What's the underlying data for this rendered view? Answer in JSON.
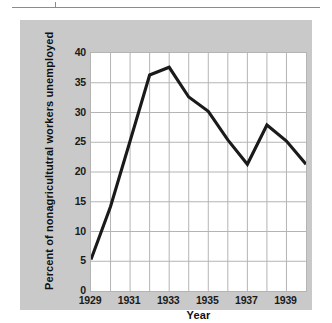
{
  "figure": {
    "background_color": "#ffffff",
    "plate_color": "#c9c9c9",
    "plot_background": "#ffffff",
    "line_color": "#1a1a1a",
    "grid_color": "#b4b4b4"
  },
  "chart_data": {
    "type": "line",
    "title": "",
    "xlabel": "Year",
    "ylabel": "Percent of nonagricultutral workers unemployed",
    "xlim": [
      1929,
      1940
    ],
    "ylim": [
      0,
      40
    ],
    "grid": true,
    "legend": "none",
    "x_tick_labels": [
      "1929",
      "1931",
      "1933",
      "1935",
      "1937",
      "1939"
    ],
    "x_tick_values": [
      1929,
      1931,
      1933,
      1935,
      1937,
      1939
    ],
    "x_minor_gridlines": [
      1930,
      1932,
      1934,
      1936,
      1938,
      1940
    ],
    "y_tick_labels": [
      "0",
      "5",
      "10",
      "15",
      "20",
      "25",
      "30",
      "35",
      "40"
    ],
    "y_tick_values": [
      0,
      5,
      10,
      15,
      20,
      25,
      30,
      35,
      40
    ],
    "x": [
      1929,
      1930,
      1931,
      1932,
      1933,
      1934,
      1935,
      1936,
      1937,
      1938,
      1939,
      1940
    ],
    "values": [
      5.3,
      14.2,
      25.2,
      36.3,
      37.6,
      32.6,
      30.2,
      25.4,
      21.3,
      27.9,
      25.2,
      21.3
    ],
    "series": [
      {
        "name": "Percent of nonagricultutral workers unemployed",
        "values": [
          5.3,
          14.2,
          25.2,
          36.3,
          37.6,
          32.6,
          30.2,
          25.4,
          21.3,
          27.9,
          25.2,
          21.3
        ]
      }
    ]
  }
}
